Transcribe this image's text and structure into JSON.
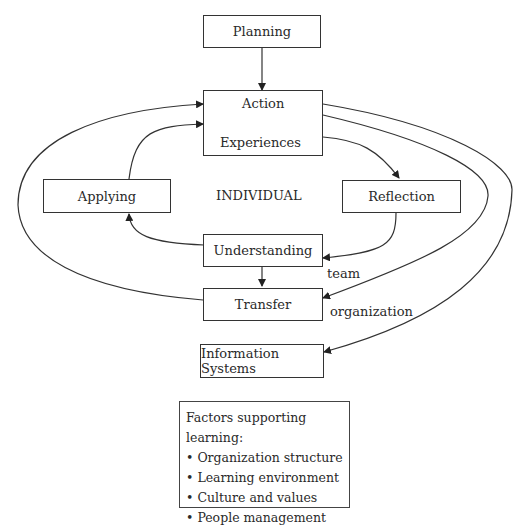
{
  "diagram": {
    "nodes": {
      "planning": "Planning",
      "action": "Action",
      "experiences": "Experiences",
      "applying": "Applying",
      "individual": "INDIVIDUAL",
      "reflection": "Reflection",
      "understanding": "Understanding",
      "transfer": "Transfer",
      "information_systems": "Information Systems"
    },
    "edge_labels": {
      "team": "team",
      "organization": "organization"
    },
    "factors": {
      "title": "Factors supporting learning:",
      "items": [
        "Organization structure",
        "Learning environment",
        "Culture and values",
        "People management"
      ]
    },
    "edges": [
      {
        "from": "Planning",
        "to": "Action/Experiences"
      },
      {
        "from": "Action",
        "to": "Experiences"
      },
      {
        "from": "Experiences",
        "to": "Action"
      },
      {
        "from": "Action/Experiences",
        "to": "Reflection"
      },
      {
        "from": "Reflection",
        "to": "Understanding"
      },
      {
        "from": "Understanding",
        "to": "Applying"
      },
      {
        "from": "Applying",
        "to": "Action/Experiences"
      },
      {
        "from": "Understanding",
        "to": "Transfer"
      },
      {
        "from": "Transfer",
        "to": "Action/Experiences"
      },
      {
        "from": "Action/Experiences",
        "to": "Transfer",
        "label": "team"
      },
      {
        "from": "Action/Experiences",
        "to": "Information Systems",
        "label": "organization"
      }
    ],
    "colors": {
      "line": "#333333",
      "text": "#2a2a2a"
    }
  }
}
